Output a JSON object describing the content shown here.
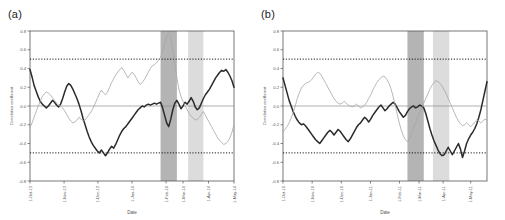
{
  "figure": {
    "panels": [
      {
        "tag": "(a)",
        "xlabel": "Date",
        "ylabel": "Correlation coefficient"
      },
      {
        "tag": "(b)",
        "xlabel": "Date",
        "ylabel": "Correlation coefficient"
      }
    ]
  },
  "chart_data": [
    {
      "type": "line",
      "title": "(a)",
      "xlabel": "Date",
      "ylabel": "Correlation coefficient",
      "ylim": [
        -0.8,
        0.8
      ],
      "yticks": [
        0.8,
        0.6,
        0.4,
        0.2,
        0.0,
        -0.2,
        -0.4,
        -0.6,
        -0.8
      ],
      "ytick_labels": [
        "0.8",
        "0.6",
        "0.4",
        "0.2",
        "0.0",
        "-0.2",
        "-0.4",
        "-0.6",
        "-0.8"
      ],
      "grid": false,
      "legend": "none",
      "x": [
        0,
        1,
        2,
        3,
        4,
        5,
        6,
        7,
        8,
        9,
        10,
        11,
        12,
        13,
        14,
        15,
        16,
        17,
        18,
        19,
        20,
        21,
        22,
        23,
        24,
        25,
        26,
        27,
        28,
        29,
        30,
        31,
        32,
        33,
        34,
        35,
        36,
        37,
        38,
        39,
        40,
        41,
        42,
        43,
        44,
        45,
        46,
        47,
        48,
        49,
        50,
        51,
        52,
        53,
        54,
        55,
        56,
        57,
        58,
        59,
        60,
        61,
        62,
        63,
        64,
        65,
        66,
        67,
        68,
        69,
        70,
        71,
        72,
        73,
        74,
        75,
        76,
        77,
        78,
        79,
        80,
        81,
        82,
        83,
        84,
        85,
        86,
        87,
        88,
        89,
        90,
        91,
        92,
        93,
        94,
        95,
        96,
        97,
        98,
        99,
        100
      ],
      "xticks": [
        0,
        16.7,
        33.3,
        50,
        66.7,
        75,
        87.5,
        100
      ],
      "xtick_labels": [
        "1-Oct-13",
        "1-Nov-13",
        "1-Dec-13",
        "1-Jan-14",
        "1-Feb-14",
        "1-Mar-14",
        "1-Apr-14",
        "1-May-14"
      ],
      "hlines": [
        {
          "y": 0.5,
          "style": "dotted",
          "color": "#000000"
        },
        {
          "y": -0.5,
          "style": "dotted",
          "color": "#000000"
        },
        {
          "y": 0.0,
          "style": "solid",
          "color": "#8c8c8c"
        }
      ],
      "shaded_bands": [
        {
          "x0": 64.0,
          "x1": 72.0,
          "color": "#b4b4b4",
          "label": "event-band-1"
        },
        {
          "x0": 77.5,
          "x1": 85.0,
          "color": "#dcdcdc",
          "label": "event-band-2"
        }
      ],
      "series": [
        {
          "name": "series-dark",
          "color": "#2b2b2b",
          "width": 1.5,
          "values": [
            0.39,
            0.31,
            0.22,
            0.16,
            0.1,
            0.05,
            0.02,
            0.0,
            -0.02,
            0.0,
            0.03,
            0.06,
            0.04,
            0.01,
            -0.01,
            0.02,
            0.08,
            0.15,
            0.21,
            0.24,
            0.22,
            0.18,
            0.13,
            0.08,
            0.02,
            -0.05,
            -0.13,
            -0.2,
            -0.27,
            -0.33,
            -0.38,
            -0.42,
            -0.45,
            -0.48,
            -0.5,
            -0.47,
            -0.5,
            -0.53,
            -0.5,
            -0.46,
            -0.43,
            -0.45,
            -0.41,
            -0.36,
            -0.31,
            -0.27,
            -0.24,
            -0.22,
            -0.19,
            -0.16,
            -0.13,
            -0.1,
            -0.07,
            -0.04,
            -0.02,
            0.0,
            -0.01,
            0.01,
            0.02,
            0.01,
            0.02,
            0.03,
            0.02,
            0.03,
            0.04,
            -0.02,
            -0.1,
            -0.18,
            -0.22,
            -0.14,
            -0.04,
            0.03,
            0.06,
            0.02,
            -0.03,
            0.0,
            0.04,
            0.02,
            0.05,
            0.09,
            0.05,
            -0.01,
            -0.04,
            -0.02,
            0.03,
            0.08,
            0.12,
            0.15,
            0.18,
            0.22,
            0.26,
            0.3,
            0.33,
            0.36,
            0.38,
            0.37,
            0.39,
            0.36,
            0.32,
            0.27,
            0.2,
            0.13
          ]
        },
        {
          "name": "series-light",
          "color": "#a6a6a6",
          "width": 0.8,
          "values": [
            -0.23,
            -0.18,
            -0.12,
            -0.06,
            0.0,
            0.05,
            0.1,
            0.13,
            0.15,
            0.14,
            0.12,
            0.09,
            0.06,
            0.03,
            0.01,
            0.0,
            -0.02,
            -0.05,
            -0.09,
            -0.13,
            -0.16,
            -0.18,
            -0.17,
            -0.15,
            -0.12,
            -0.14,
            -0.16,
            -0.15,
            -0.12,
            -0.09,
            -0.06,
            -0.02,
            0.03,
            0.08,
            0.13,
            0.17,
            0.14,
            0.12,
            0.15,
            0.2,
            0.25,
            0.29,
            0.33,
            0.36,
            0.39,
            0.41,
            0.38,
            0.34,
            0.3,
            0.33,
            0.36,
            0.34,
            0.3,
            0.26,
            0.23,
            0.25,
            0.28,
            0.32,
            0.36,
            0.4,
            0.43,
            0.44,
            0.46,
            0.49,
            0.52,
            0.58,
            0.66,
            0.74,
            0.78,
            0.72,
            0.6,
            0.45,
            0.3,
            0.18,
            0.1,
            0.05,
            0.0,
            -0.04,
            -0.08,
            -0.11,
            -0.13,
            -0.15,
            -0.14,
            -0.12,
            -0.09,
            -0.06,
            -0.1,
            -0.14,
            -0.18,
            -0.22,
            -0.26,
            -0.3,
            -0.34,
            -0.37,
            -0.39,
            -0.41,
            -0.4,
            -0.38,
            -0.34,
            -0.28,
            -0.2,
            -0.08
          ]
        }
      ]
    },
    {
      "type": "line",
      "title": "(b)",
      "xlabel": "Date",
      "ylabel": "Correlation coefficient",
      "ylim": [
        -0.8,
        0.8
      ],
      "yticks": [
        0.8,
        0.6,
        0.4,
        0.2,
        0.0,
        -0.2,
        -0.4,
        -0.6,
        -0.8
      ],
      "ytick_labels": [
        "0.8",
        "0.6",
        "0.4",
        "0.2",
        "0.0",
        "-0.2",
        "-0.4",
        "-0.6",
        "-0.8"
      ],
      "grid": false,
      "legend": "none",
      "x": [
        0,
        1,
        2,
        3,
        4,
        5,
        6,
        7,
        8,
        9,
        10,
        11,
        12,
        13,
        14,
        15,
        16,
        17,
        18,
        19,
        20,
        21,
        22,
        23,
        24,
        25,
        26,
        27,
        28,
        29,
        30,
        31,
        32,
        33,
        34,
        35,
        36,
        37,
        38,
        39,
        40,
        41,
        42,
        43,
        44,
        45,
        46,
        47,
        48,
        49,
        50,
        51,
        52,
        53,
        54,
        55,
        56,
        57,
        58,
        59,
        60,
        61,
        62,
        63,
        64,
        65,
        66,
        67,
        68,
        69,
        70,
        71,
        72,
        73,
        74,
        75,
        76,
        77,
        78,
        79,
        80,
        81,
        82,
        83,
        84,
        85,
        86,
        87,
        88,
        89,
        90,
        91,
        92,
        93,
        94,
        95,
        96,
        97,
        98,
        99,
        100
      ],
      "xticks": [
        0,
        14.3,
        28.6,
        42.9,
        57.1,
        66.7,
        78.5,
        92.0
      ],
      "xtick_labels": [
        "1-Oct-10",
        "1-Nov-10",
        "1-Dec-10",
        "1-Jan-11",
        "1-Feb-11",
        "1-Mar-11",
        "1-Apr-11",
        "1-May-11",
        "1-Jun-11"
      ],
      "hlines": [
        {
          "y": 0.5,
          "style": "dotted",
          "color": "#000000"
        },
        {
          "y": -0.5,
          "style": "dotted",
          "color": "#000000"
        },
        {
          "y": 0.0,
          "style": "solid",
          "color": "#8c8c8c"
        }
      ],
      "shaded_bands": [
        {
          "x0": 61.0,
          "x1": 69.0,
          "color": "#b4b4b4",
          "label": "event-band-1"
        },
        {
          "x0": 73.5,
          "x1": 81.5,
          "color": "#dcdcdc",
          "label": "event-band-2"
        }
      ],
      "series": [
        {
          "name": "series-dark",
          "color": "#2b2b2b",
          "width": 1.5,
          "values": [
            0.3,
            0.22,
            0.14,
            0.06,
            0.0,
            -0.06,
            -0.11,
            -0.15,
            -0.18,
            -0.2,
            -0.19,
            -0.21,
            -0.24,
            -0.27,
            -0.3,
            -0.33,
            -0.36,
            -0.38,
            -0.4,
            -0.37,
            -0.34,
            -0.31,
            -0.28,
            -0.26,
            -0.28,
            -0.31,
            -0.28,
            -0.25,
            -0.27,
            -0.3,
            -0.33,
            -0.36,
            -0.38,
            -0.35,
            -0.31,
            -0.27,
            -0.23,
            -0.2,
            -0.18,
            -0.15,
            -0.12,
            -0.14,
            -0.17,
            -0.14,
            -0.1,
            -0.07,
            -0.04,
            -0.01,
            0.01,
            -0.02,
            -0.05,
            -0.03,
            0.0,
            0.02,
            0.04,
            0.02,
            -0.02,
            -0.06,
            -0.09,
            -0.12,
            -0.1,
            -0.06,
            -0.03,
            -0.01,
            0.0,
            -0.02,
            -0.01,
            0.01,
            0.0,
            -0.02,
            -0.08,
            -0.16,
            -0.24,
            -0.31,
            -0.37,
            -0.42,
            -0.47,
            -0.51,
            -0.53,
            -0.52,
            -0.48,
            -0.44,
            -0.48,
            -0.52,
            -0.48,
            -0.44,
            -0.4,
            -0.46,
            -0.55,
            -0.48,
            -0.4,
            -0.35,
            -0.31,
            -0.28,
            -0.24,
            -0.19,
            -0.12,
            -0.04,
            0.06,
            0.16,
            0.26,
            0.3,
            0.41
          ]
        },
        {
          "name": "series-light",
          "color": "#a6a6a6",
          "width": 0.8,
          "values": [
            -0.28,
            -0.25,
            -0.22,
            -0.18,
            -0.13,
            -0.07,
            0.0,
            0.08,
            0.14,
            0.19,
            0.22,
            0.24,
            0.25,
            0.26,
            0.28,
            0.31,
            0.34,
            0.36,
            0.35,
            0.32,
            0.28,
            0.24,
            0.2,
            0.16,
            0.12,
            0.08,
            0.05,
            0.03,
            0.02,
            0.03,
            0.05,
            0.03,
            0.01,
            0.0,
            -0.01,
            0.0,
            0.02,
            0.0,
            -0.02,
            -0.01,
            0.01,
            0.04,
            0.08,
            0.12,
            0.17,
            0.21,
            0.25,
            0.28,
            0.3,
            0.32,
            0.31,
            0.28,
            0.24,
            0.18,
            0.1,
            0.01,
            -0.09,
            -0.18,
            -0.26,
            -0.32,
            -0.36,
            -0.38,
            -0.35,
            -0.3,
            -0.24,
            -0.18,
            -0.12,
            -0.07,
            -0.02,
            0.03,
            0.08,
            0.13,
            0.18,
            0.22,
            0.25,
            0.27,
            0.26,
            0.24,
            0.21,
            0.17,
            0.13,
            0.08,
            0.03,
            -0.02,
            -0.07,
            -0.12,
            -0.16,
            -0.19,
            -0.21,
            -0.2,
            -0.18,
            -0.2,
            -0.22,
            -0.2,
            -0.17,
            -0.15,
            -0.16,
            -0.18,
            -0.16,
            -0.14,
            -0.15,
            -0.14
          ]
        }
      ]
    }
  ]
}
